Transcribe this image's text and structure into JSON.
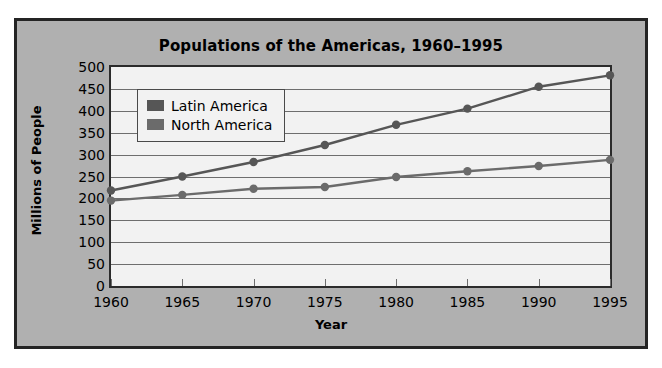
{
  "chart_data": {
    "type": "line",
    "title": "Populations of the Americas, 1960–1995",
    "xlabel": "Year",
    "ylabel": "Millions of People",
    "categories": [
      1960,
      1965,
      1970,
      1975,
      1980,
      1985,
      1990,
      1995
    ],
    "xtick_labels": [
      "1960",
      "1965",
      "1970",
      "1975",
      "1980",
      "1985",
      "1990",
      "1995"
    ],
    "ytick_labels": [
      "0",
      "50",
      "100",
      "150",
      "200",
      "250",
      "300",
      "350",
      "400",
      "450",
      "500"
    ],
    "ytick_values": [
      0,
      50,
      100,
      150,
      200,
      250,
      300,
      350,
      400,
      450,
      500
    ],
    "ylim": [
      0,
      500
    ],
    "xlim": [
      1960,
      1995
    ],
    "grid": "horizontal",
    "legend_position": "upper left",
    "series": [
      {
        "name": "Latin America",
        "color": "#565656",
        "values": [
          218,
          250,
          283,
          322,
          368,
          405,
          455,
          481
        ]
      },
      {
        "name": "North America",
        "color": "#6b6b6b",
        "values": [
          195,
          208,
          222,
          226,
          249,
          262,
          274,
          288
        ]
      }
    ]
  },
  "figure": {
    "background": "#b0b0b0",
    "border_color": "#242424",
    "plot_background": "#f2f2f2",
    "gridline_color": "#6e6e6e"
  }
}
